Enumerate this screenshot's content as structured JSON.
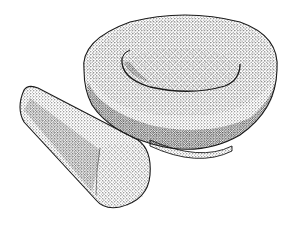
{
  "illustration": {
    "subject": "mortar and pestle",
    "style": "stippled pen-and-ink drawing",
    "background": "#ffffff",
    "ink": "#1a1a1a",
    "objects": [
      {
        "name": "mortar",
        "description": "wide round stone bowl with thick rim and shallow inner basin"
      },
      {
        "name": "pestle",
        "description": "conical stone pestle lying in front-left, flat end facing viewer"
      }
    ]
  }
}
